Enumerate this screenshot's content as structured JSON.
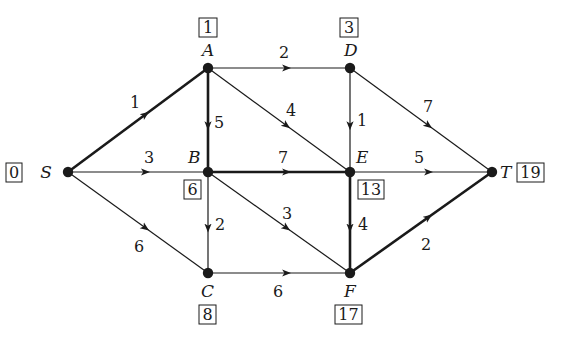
{
  "diagram": {
    "type": "directed-weighted-graph-critical-path",
    "colors": {
      "ink": "#1a1a1a",
      "background": "#ffffff"
    },
    "nodes": [
      {
        "id": "S",
        "label": "S",
        "x": 68,
        "y": 172,
        "value": "0",
        "label_dx": -16,
        "label_dy": 6,
        "box_x": 6,
        "box_y": 163,
        "box_w": 16,
        "box_h": 19
      },
      {
        "id": "A",
        "label": "A",
        "x": 208,
        "y": 68,
        "value": "1",
        "label_dx": -6,
        "label_dy": -12,
        "box_x": 199,
        "box_y": 18,
        "box_w": 18,
        "box_h": 19
      },
      {
        "id": "D",
        "label": "D",
        "x": 350,
        "y": 68,
        "value": "3",
        "label_dx": -6,
        "label_dy": -12,
        "box_x": 340,
        "box_y": 18,
        "box_w": 18,
        "box_h": 19
      },
      {
        "id": "B",
        "label": "B",
        "x": 208,
        "y": 172,
        "value": "6",
        "label_dx": -20,
        "label_dy": -9,
        "box_x": 184,
        "box_y": 180,
        "box_w": 17,
        "box_h": 19
      },
      {
        "id": "E",
        "label": "E",
        "x": 350,
        "y": 172,
        "value": "13",
        "label_dx": 6,
        "label_dy": -9,
        "box_x": 358,
        "box_y": 180,
        "box_w": 26,
        "box_h": 19
      },
      {
        "id": "T",
        "label": "T",
        "x": 492,
        "y": 172,
        "value": "19",
        "label_dx": 8,
        "label_dy": 6,
        "box_x": 517,
        "box_y": 163,
        "box_w": 27,
        "box_h": 19
      },
      {
        "id": "C",
        "label": "C",
        "x": 208,
        "y": 273,
        "value": "8",
        "label_dx": -7,
        "label_dy": 24,
        "box_x": 199,
        "box_y": 305,
        "box_w": 17,
        "box_h": 19
      },
      {
        "id": "F",
        "label": "F",
        "x": 350,
        "y": 273,
        "value": "17",
        "label_dx": -6,
        "label_dy": 24,
        "box_x": 335,
        "box_y": 305,
        "box_w": 27,
        "box_h": 19
      }
    ],
    "edges": [
      {
        "from": "S",
        "to": "A",
        "weight": "1",
        "critical": true,
        "wx": 130,
        "wy": 108
      },
      {
        "from": "S",
        "to": "B",
        "weight": "3",
        "critical": false,
        "wx": 144,
        "wy": 163
      },
      {
        "from": "S",
        "to": "C",
        "weight": "6",
        "critical": false,
        "wx": 134,
        "wy": 252
      },
      {
        "from": "A",
        "to": "D",
        "weight": "2",
        "critical": false,
        "wx": 279,
        "wy": 58
      },
      {
        "from": "A",
        "to": "B",
        "weight": "5",
        "critical": true,
        "wx": 214,
        "wy": 128
      },
      {
        "from": "A",
        "to": "E",
        "weight": "4",
        "critical": false,
        "wx": 286,
        "wy": 116
      },
      {
        "from": "D",
        "to": "E",
        "weight": "1",
        "critical": false,
        "wx": 357,
        "wy": 126
      },
      {
        "from": "D",
        "to": "T",
        "weight": "7",
        "critical": false,
        "wx": 423,
        "wy": 112
      },
      {
        "from": "B",
        "to": "E",
        "weight": "7",
        "critical": true,
        "wx": 278,
        "wy": 163
      },
      {
        "from": "B",
        "to": "C",
        "weight": "2",
        "critical": false,
        "wx": 215,
        "wy": 230
      },
      {
        "from": "B",
        "to": "F",
        "weight": "3",
        "critical": false,
        "wx": 282,
        "wy": 219
      },
      {
        "from": "E",
        "to": "T",
        "weight": "5",
        "critical": false,
        "wx": 414,
        "wy": 163
      },
      {
        "from": "E",
        "to": "F",
        "weight": "4",
        "critical": true,
        "wx": 358,
        "wy": 230
      },
      {
        "from": "C",
        "to": "F",
        "weight": "6",
        "critical": false,
        "wx": 273,
        "wy": 297
      },
      {
        "from": "F",
        "to": "T",
        "weight": "2",
        "critical": true,
        "wx": 421,
        "wy": 250
      }
    ]
  }
}
